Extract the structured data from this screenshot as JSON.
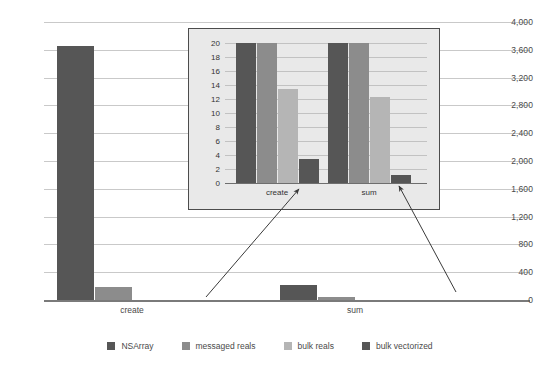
{
  "chart_data": {
    "type": "bar",
    "title": "",
    "xlabel": "",
    "ylabel": "",
    "categories": [
      "create",
      "sum"
    ],
    "series": [
      {
        "name": "NSArray",
        "color": "#565656",
        "values": [
          3660,
          220
        ]
      },
      {
        "name": "messaged reals",
        "color": "#8c8c8c",
        "values": [
          180,
          45
        ]
      },
      {
        "name": "bulk reals",
        "color": "#b5b5b5",
        "values": [
          0,
          0
        ]
      },
      {
        "name": "bulk vectorized",
        "color": "#565656",
        "values": [
          0,
          0
        ]
      }
    ],
    "ylim": [
      0,
      4000
    ],
    "ytick_step": 400,
    "ytick_labels": [
      "0",
      "400",
      "800",
      "1,200",
      "1,600",
      "2,000",
      "2,400",
      "2,800",
      "3,200",
      "3,600",
      "4,000"
    ],
    "grid": true,
    "legend_position": "bottom",
    "inset": {
      "type": "bar",
      "categories": [
        "create",
        "sum"
      ],
      "series": [
        {
          "name": "NSArray",
          "color": "#565656",
          "values": [
            20,
            20
          ]
        },
        {
          "name": "messaged reals",
          "color": "#8c8c8c",
          "values": [
            20,
            20
          ]
        },
        {
          "name": "bulk reals",
          "color": "#b5b5b5",
          "values": [
            13.5,
            12.3
          ]
        },
        {
          "name": "bulk vectorized",
          "color": "#565656",
          "values": [
            3.5,
            1.2
          ]
        }
      ],
      "ylim": [
        0,
        20
      ],
      "ytick_step": 2,
      "ytick_labels": [
        "0",
        "2",
        "4",
        "6",
        "8",
        "10",
        "12",
        "14",
        "16",
        "18",
        "20"
      ],
      "grid": true,
      "note": "values for NSArray and messaged reals are clipped at the top of the axis"
    }
  },
  "legend": {
    "items": [
      {
        "label": "NSArray",
        "color": "#565656"
      },
      {
        "label": "messaged reals",
        "color": "#8c8c8c"
      },
      {
        "label": "bulk reals",
        "color": "#b5b5b5"
      },
      {
        "label": "bulk vectorized",
        "color": "#565656"
      }
    ]
  }
}
